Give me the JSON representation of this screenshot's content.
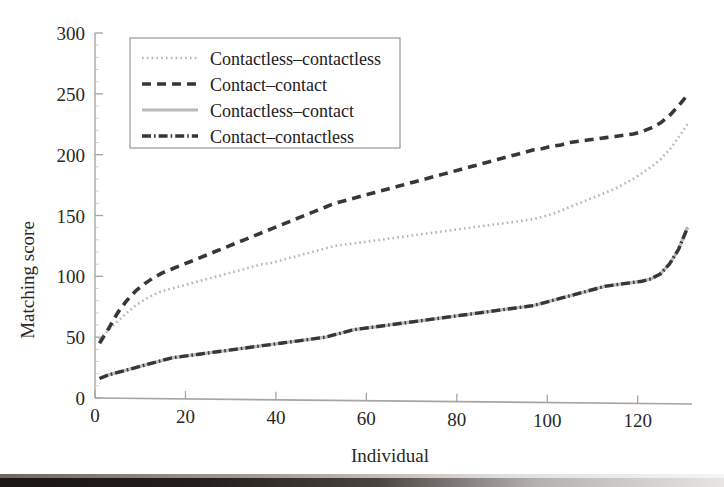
{
  "chart_data": {
    "type": "line",
    "title": "",
    "xlabel": "Individual",
    "ylabel": "Matching score",
    "xlim": [
      0,
      132
    ],
    "ylim": [
      0,
      300
    ],
    "xticks": [
      0,
      20,
      40,
      60,
      80,
      100,
      120
    ],
    "yticks": [
      0,
      50,
      100,
      150,
      200,
      250,
      300
    ],
    "grid": false,
    "legend_position": "upper left",
    "x": [
      1,
      3,
      5,
      7,
      9,
      11,
      13,
      15,
      17,
      19,
      21,
      23,
      25,
      27,
      29,
      31,
      33,
      35,
      37,
      39,
      41,
      43,
      45,
      47,
      49,
      51,
      53,
      55,
      57,
      59,
      61,
      63,
      65,
      67,
      69,
      71,
      73,
      75,
      77,
      79,
      81,
      83,
      85,
      87,
      89,
      91,
      93,
      95,
      97,
      99,
      101,
      103,
      105,
      107,
      109,
      111,
      113,
      115,
      117,
      119,
      121,
      123,
      125,
      127,
      129,
      131
    ],
    "series": [
      {
        "name": "Contactless-contactless",
        "style": "dotted",
        "color": "#b9b5b1",
        "values": [
          48,
          56,
          63,
          70,
          76,
          81,
          85,
          88,
          90,
          92,
          94,
          96,
          98,
          100,
          102,
          104,
          106,
          108,
          110,
          111,
          113,
          115,
          117,
          119,
          121,
          123,
          125,
          126,
          127,
          128,
          129,
          130,
          131,
          132,
          133,
          134,
          135,
          136,
          137,
          138,
          139,
          140,
          141,
          142,
          143,
          144,
          145,
          146,
          147,
          149,
          151,
          154,
          157,
          160,
          163,
          166,
          169,
          172,
          176,
          180,
          185,
          190,
          196,
          204,
          214,
          225
        ]
      },
      {
        "name": "Contact-contact",
        "style": "dashed",
        "color": "#3a3633",
        "values": [
          45,
          57,
          70,
          80,
          88,
          94,
          99,
          103,
          106,
          109,
          112,
          115,
          118,
          121,
          124,
          127,
          130,
          133,
          136,
          139,
          142,
          145,
          148,
          151,
          154,
          157,
          160,
          162,
          164,
          166,
          168,
          170,
          172,
          174,
          176,
          178,
          180,
          182,
          184,
          186,
          188,
          190,
          192,
          194,
          196,
          198,
          200,
          202,
          204,
          205,
          207,
          208,
          210,
          211,
          212,
          213,
          214,
          215,
          216,
          217,
          219,
          222,
          226,
          232,
          240,
          249
        ]
      },
      {
        "name": "Contactless-contact",
        "style": "solid",
        "color": "#bdb9b6",
        "values": [
          16,
          19,
          21,
          23,
          25,
          27,
          29,
          31,
          33,
          34,
          35,
          36,
          37,
          38,
          39,
          40,
          41,
          42,
          43,
          44,
          45,
          46,
          47,
          48,
          49,
          50,
          52,
          54,
          56,
          57,
          58,
          59,
          60,
          61,
          62,
          63,
          64,
          65,
          66,
          67,
          68,
          69,
          70,
          71,
          72,
          73,
          74,
          75,
          76,
          78,
          80,
          82,
          84,
          86,
          88,
          90,
          92,
          93,
          94,
          95,
          96,
          98,
          102,
          110,
          122,
          140
        ]
      },
      {
        "name": "Contact-contactless",
        "style": "dashdot",
        "color": "#3a3633",
        "values": [
          16,
          19,
          21,
          23,
          25,
          27,
          29,
          31,
          33,
          34,
          35,
          36,
          37,
          38,
          39,
          40,
          41,
          42,
          43,
          44,
          45,
          46,
          47,
          48,
          49,
          50,
          52,
          54,
          56,
          57,
          58,
          59,
          60,
          61,
          62,
          63,
          64,
          65,
          66,
          67,
          68,
          69,
          70,
          71,
          72,
          73,
          74,
          75,
          76,
          78,
          80,
          82,
          84,
          86,
          88,
          90,
          92,
          93,
          94,
          95,
          96,
          98,
          102,
          110,
          122,
          140
        ]
      }
    ]
  },
  "legend": {
    "entries": [
      {
        "label": "Contactless-contactless",
        "style": "dotted"
      },
      {
        "label": "Contact-contact",
        "style": "dashed"
      },
      {
        "label": "Contactless-contact",
        "style": "solid"
      },
      {
        "label": "Contact-contactless",
        "style": "dashdot"
      }
    ]
  }
}
